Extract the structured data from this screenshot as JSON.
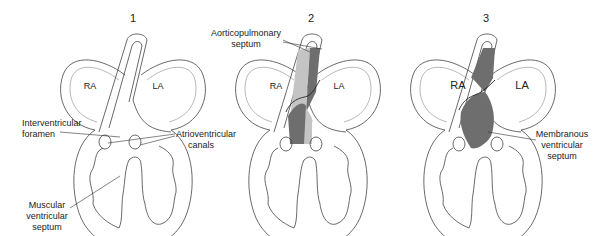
{
  "figure": {
    "panels": [
      {
        "number": "1",
        "chambers": {
          "right_atrium": "RA",
          "left_atrium": "LA"
        },
        "labels": [
          {
            "id": "interventricular-foramen",
            "lines": [
              "Interventricular",
              "foramen"
            ]
          },
          {
            "id": "atrioventricular-canals",
            "lines": [
              "Atrioventricular",
              "canals"
            ]
          },
          {
            "id": "muscular-ventricular-septum",
            "lines": [
              "Muscular",
              "ventricular",
              "septum"
            ]
          }
        ]
      },
      {
        "number": "2",
        "chambers": {
          "right_atrium": "RA",
          "left_atrium": "LA"
        },
        "labels": [
          {
            "id": "aorticopulmonary-septum",
            "lines": [
              "Aorticopulmonary",
              "septum"
            ]
          }
        ]
      },
      {
        "number": "3",
        "chambers": {
          "right_atrium": "RA",
          "left_atrium": "LA"
        },
        "labels": [
          {
            "id": "membranous-ventricular-septum",
            "lines": [
              "Membranous",
              "ventricular",
              "septum"
            ]
          }
        ]
      }
    ],
    "colors": {
      "dark_fill": "#6e6e6e",
      "light_fill": "#c4c4c4",
      "stroke": "#444444"
    }
  }
}
